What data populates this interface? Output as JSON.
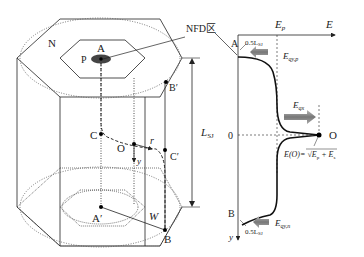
{
  "figure": {
    "left": {
      "region_outer": "N",
      "region_inner": "P",
      "points": {
        "A": "A",
        "A_prime": "A′",
        "B": "B",
        "B_prime": "B′",
        "C": "C",
        "C_prime": "C′",
        "O": "O"
      },
      "labels": {
        "r": "r",
        "y": "y",
        "W": "W",
        "L": "L",
        "L_sub": "SJ"
      },
      "callout": "NFD区"
    },
    "right": {
      "axis_x": "E",
      "axis_y": "y",
      "Ep": "E",
      "Ep_sub": "p",
      "zero": "0",
      "point_top": "A",
      "point_bottom": "B",
      "point_O": "O",
      "top_offset": "0.5L",
      "top_offset_sub": "SJ",
      "bottom_offset": "0.5L",
      "bottom_offset_sub": "SJ",
      "Eqyp": "E",
      "Eqyp_sub": "qy,p",
      "Eqx": "E",
      "Eqx_sub": "qx",
      "Eqyn": "E",
      "Eqyn_sub": "qy,n",
      "formula_lhs": "E(O)=",
      "formula_rhs": "E",
      "formula_rhs2": "+ E"
    },
    "colors": {
      "line": "#222222",
      "arrow_fill": "#8a8a8a",
      "ellipse": "#555555"
    }
  }
}
